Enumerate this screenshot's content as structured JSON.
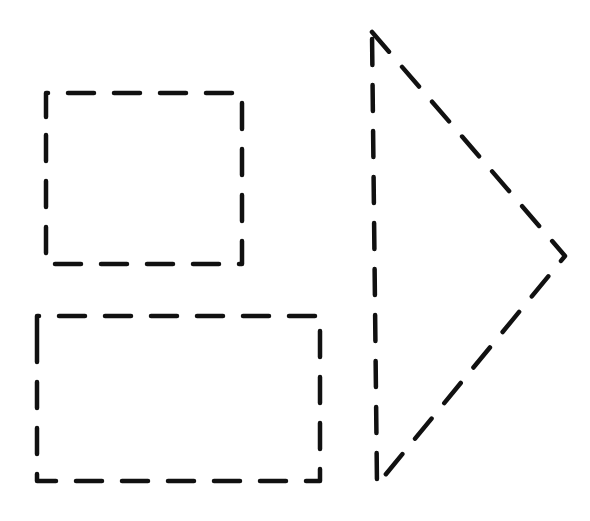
{
  "canvas": {
    "width": 590,
    "height": 521,
    "background": "#ffffff"
  },
  "stroke": {
    "color": "#111111",
    "width": 4.5,
    "dash": "26 20"
  },
  "shapes": {
    "square": {
      "type": "dashed-square",
      "x": 46,
      "y": 93,
      "width": 196,
      "height": 171
    },
    "rectangle": {
      "type": "dashed-rectangle",
      "x": 37,
      "y": 316,
      "width": 283,
      "height": 165
    },
    "triangle": {
      "type": "dashed-triangle",
      "points": [
        [
          372,
          32
        ],
        [
          565,
          256
        ],
        [
          377,
          485
        ]
      ]
    }
  }
}
